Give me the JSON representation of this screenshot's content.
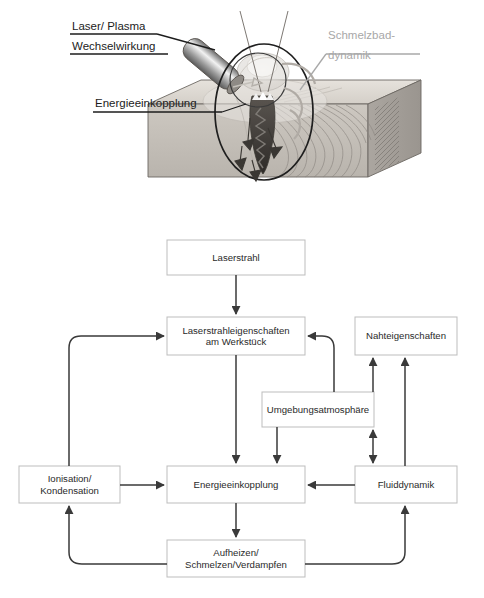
{
  "figure": {
    "top_illustration": {
      "title": "laser-welding-process-illustration",
      "labels": [
        {
          "id": "laser-plasma",
          "line1": "Laser/ Plasma",
          "line2": "Wechselwirkung",
          "color": "#1c1c1c"
        },
        {
          "id": "schmelzbad",
          "line1": "Schmelzbad-",
          "line2": "dynamik",
          "color": "#a8a8a8"
        },
        {
          "id": "energieeinkopplung",
          "line1": "Energieeinkopplung",
          "line2": "",
          "color": "#1c1c1c"
        }
      ]
    },
    "flowchart": {
      "type": "diagram",
      "nodes": [
        {
          "id": "laserstrahl",
          "label": "Laserstrahl",
          "x": 167,
          "y": 240,
          "w": 138,
          "h": 35
        },
        {
          "id": "laserstrahleigenschaften",
          "label": "Laserstrahleigenschaften\nam Werkstück",
          "line1": "Laserstrahleigenschaften",
          "line2": "am Werkstück",
          "x": 167,
          "y": 317,
          "w": 138,
          "h": 38
        },
        {
          "id": "nahteigenschaften",
          "label": "Nahteigenschaften",
          "x": 355,
          "y": 317,
          "w": 102,
          "h": 38
        },
        {
          "id": "umgebungsatmosphaere",
          "label": "Umgebungsatmosphäre",
          "x": 262,
          "y": 392,
          "w": 112,
          "h": 35
        },
        {
          "id": "ionisation-kondensation",
          "label": "Ionisation/\nKondensation",
          "line1": "Ionisation/",
          "line2": "Kondensation",
          "x": 19,
          "y": 466,
          "w": 101,
          "h": 37
        },
        {
          "id": "energieeinkopplung",
          "label": "Energieeinkopplung",
          "x": 167,
          "y": 466,
          "w": 138,
          "h": 37
        },
        {
          "id": "fluiddynamik",
          "label": "Fluiddynamik",
          "x": 355,
          "y": 466,
          "w": 102,
          "h": 37
        },
        {
          "id": "aufheizen",
          "label": "Aufheizen/\nSchmelzen/Verdampfen",
          "line1": "Aufheizen/",
          "line2": "Schmelzen/Verdampfen",
          "x": 167,
          "y": 540,
          "w": 138,
          "h": 37
        }
      ],
      "edges": [
        {
          "from": "laserstrahl",
          "to": "laserstrahleigenschaften",
          "style": "straight-down"
        },
        {
          "from": "laserstrahleigenschaften",
          "to": "energieeinkopplung",
          "style": "straight-down"
        },
        {
          "from": "ionisation-kondensation",
          "to": "laserstrahleigenschaften",
          "style": "curve-left-up"
        },
        {
          "from": "ionisation-kondensation",
          "to": "energieeinkopplung",
          "style": "straight-right"
        },
        {
          "from": "umgebungsatmosphaere",
          "to": "laserstrahleigenschaften",
          "style": "curve-right-up"
        },
        {
          "from": "umgebungsatmosphaere",
          "to": "energieeinkopplung",
          "style": "straight-down"
        },
        {
          "from": "umgebungsatmosphaere",
          "to": "nahteigenschaften",
          "style": "straight-up"
        },
        {
          "from": "umgebungsatmosphaere",
          "to": "fluiddynamik",
          "style": "double-headed-down"
        },
        {
          "from": "fluiddynamik",
          "to": "nahteigenschaften",
          "style": "straight-up"
        },
        {
          "from": "fluiddynamik",
          "to": "energieeinkopplung",
          "style": "straight-left"
        },
        {
          "from": "energieeinkopplung",
          "to": "aufheizen",
          "style": "straight-down"
        },
        {
          "from": "aufheizen",
          "to": "ionisation-kondensation",
          "style": "curve-bottom-left-up"
        },
        {
          "from": "aufheizen",
          "to": "fluiddynamik",
          "style": "curve-bottom-right-up"
        }
      ]
    },
    "colors": {
      "line": "#3a3a3a",
      "box_border": "#bdbdbd",
      "text": "#2a2a2a",
      "gray_label": "#a8a8a8",
      "background": "#ffffff"
    }
  }
}
